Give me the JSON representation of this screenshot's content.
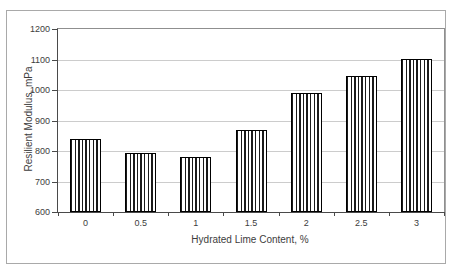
{
  "chart_data": {
    "type": "bar",
    "title": "",
    "xlabel": "Hydrated Lime Content, %",
    "ylabel": "Resilient Modulus, mPa",
    "categories": [
      "0",
      "0.5",
      "1",
      "1.5",
      "2",
      "2.5",
      "3"
    ],
    "values": [
      840,
      795,
      780,
      870,
      990,
      1045,
      1100
    ],
    "series": [
      {
        "name": "Resilient Modulus",
        "values": [
          840,
          795,
          780,
          870,
          990,
          1045,
          1100
        ]
      }
    ],
    "ylim": [
      600,
      1200
    ],
    "ytick_step": 100,
    "yticks": [
      600,
      700,
      800,
      900,
      1000,
      1100,
      1200
    ],
    "grid": "horizontal",
    "legend_position": "none",
    "bar_fill_pattern": "vertical-stripes",
    "colors": {
      "stripe": "#1a1a1a",
      "bar_bg": "#ffffff",
      "bar_border": "#000000",
      "gridline": "#cccccc",
      "axis": "#4a4a4a",
      "text": "#3d3d3d",
      "figure_border": "#a9a9a9",
      "background": "#ffffff"
    }
  }
}
